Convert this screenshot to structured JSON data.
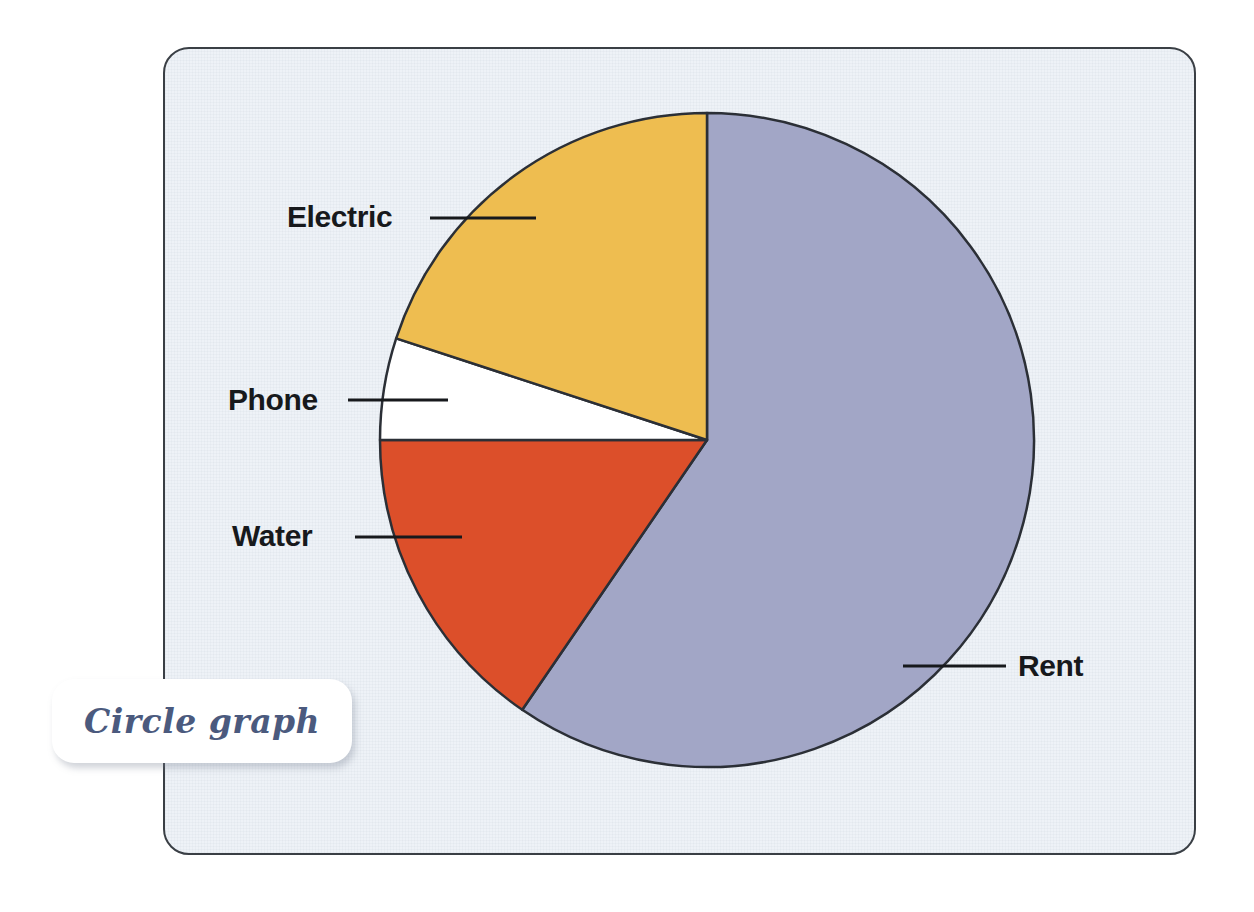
{
  "caption": {
    "text": "Circle graph"
  },
  "panel": {
    "background_color": "#eef2f7",
    "border_color": "#3a3f45"
  },
  "chart_data": {
    "type": "pie",
    "title": "Circle graph",
    "subtitle": "",
    "xlabel": "",
    "ylabel": "",
    "legend_position": "callout-labels",
    "grid": false,
    "center": {
      "x": 707,
      "y": 440
    },
    "radius": 327,
    "start_angle_deg": 0,
    "direction": "clockwise",
    "outline_color": "#2b2f36",
    "categories": [
      "Rent",
      "Water",
      "Phone",
      "Electric"
    ],
    "values": [
      59.5,
      15.5,
      5.0,
      20.0
    ],
    "slices": [
      {
        "label": "Rent",
        "value": 59.5,
        "color": "#a2a6c6",
        "start_angle_deg": 0,
        "end_angle_deg": 214.4,
        "label_side": "right",
        "label_x": 1018,
        "label_y": 651,
        "leader_x1": 903,
        "leader_x2": 1006,
        "leader_y": 666
      },
      {
        "label": "Water",
        "value": 15.5,
        "color": "#dc4f2a",
        "start_angle_deg": 214.4,
        "end_angle_deg": 270,
        "label_side": "left",
        "label_x": 232,
        "label_y": 521,
        "leader_x1": 355,
        "leader_x2": 462,
        "leader_y": 537
      },
      {
        "label": "Phone",
        "value": 5.0,
        "color": "#ffffff",
        "start_angle_deg": 270,
        "end_angle_deg": 288.1,
        "label_side": "left",
        "label_x": 228,
        "label_y": 385,
        "leader_x1": 348,
        "leader_x2": 448,
        "leader_y": 400
      },
      {
        "label": "Electric",
        "value": 20.0,
        "color": "#eebd50",
        "start_angle_deg": 288.1,
        "end_angle_deg": 360,
        "label_side": "left",
        "label_x": 287,
        "label_y": 202,
        "leader_x1": 430,
        "leader_x2": 536,
        "leader_y": 218
      }
    ],
    "leader_line_color": "#17191c",
    "leader_line_width": 3
  }
}
